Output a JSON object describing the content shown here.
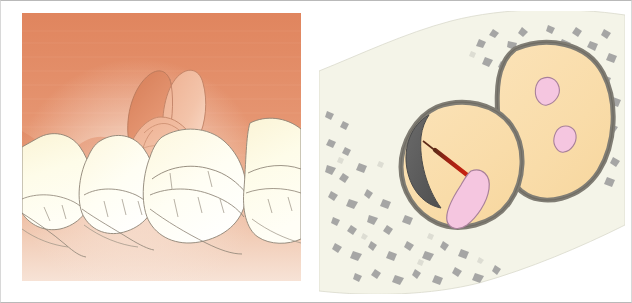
{
  "figure": {
    "panel_count": 2,
    "frame_color": "#b9b9b9",
    "background": "#ffffff"
  },
  "panels": [
    {
      "id": "left",
      "name": "clinical-intraoral-view",
      "description": "Intraoral illustration of lower molars with inflamed operculum over a partially erupted third molar",
      "labels": [],
      "colors": {
        "gingiva_top": "#e08a63",
        "gingiva_mid": "#e69b77",
        "gingiva_pale": "#f0cdb8",
        "operculum_dark": "#d98159",
        "operculum_light": "#edab8b",
        "tooth_fill": "#fdfbe8",
        "tooth_shadow": "#f5efc9",
        "outline": "#8d8375"
      },
      "elements": [
        {
          "name": "gingiva-background",
          "kind": "soft-tissue"
        },
        {
          "name": "erupting-third-molar-crown",
          "kind": "tooth"
        },
        {
          "name": "operculum-flap",
          "kind": "soft-tissue"
        },
        {
          "name": "second-molar",
          "kind": "tooth"
        },
        {
          "name": "first-molar",
          "kind": "tooth"
        },
        {
          "name": "second-premolar",
          "kind": "tooth"
        },
        {
          "name": "distal-molar",
          "kind": "tooth"
        }
      ]
    },
    {
      "id": "right",
      "name": "root-cross-section-view",
      "description": "Cross-section through two roots in trabecular bone showing a carious lesion and fracture line reaching the pulp",
      "labels": [],
      "colors": {
        "bone_field": "#f4f4e8",
        "trabeculae": "#9b9b9b",
        "trabeculae_light": "#c9c9c4",
        "dentin_fill": "#fadfae",
        "cementum_outline": "#807d74",
        "pulp_fill": "#f5c6e0",
        "pulp_outline": "#9b7c8c",
        "caries_lesion": "#5d5d5d",
        "fracture_line": "#c81f10",
        "fracture_line_dark": "#6b2b18"
      },
      "elements": [
        {
          "name": "trabecular-bone-field",
          "kind": "bone"
        },
        {
          "name": "mesial-root-section",
          "kind": "root"
        },
        {
          "name": "distal-root-section",
          "kind": "root"
        },
        {
          "name": "carious-lesion",
          "kind": "pathology"
        },
        {
          "name": "fracture-line",
          "kind": "pathology"
        },
        {
          "name": "pulp-canal-mesial",
          "kind": "pulp"
        },
        {
          "name": "pulp-canal-distal-upper",
          "kind": "pulp"
        },
        {
          "name": "pulp-canal-distal-lower",
          "kind": "pulp"
        }
      ]
    }
  ]
}
